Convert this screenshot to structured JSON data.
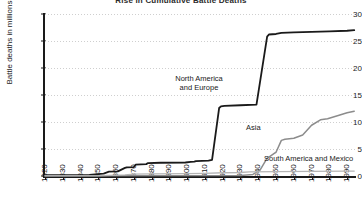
{
  "chart_data": {
    "type": "line",
    "title": "Rise in Cumulative Battle Deaths",
    "xlabel": "",
    "ylabel": "Battle deaths in millions",
    "xlim": [
      1820,
      1995
    ],
    "ylim": [
      0,
      30
    ],
    "grid": true,
    "legend_position": "inline-annotations",
    "xticks": [
      "1820",
      "1830",
      "1840",
      "1850",
      "1860",
      "1870",
      "1880",
      "1890",
      "1900",
      "1910",
      "1920",
      "1930",
      "1940",
      "1950",
      "1960",
      "1970",
      "1980",
      "1990"
    ],
    "yticks": [
      "0",
      "5",
      "10",
      "15",
      "20",
      "25",
      "30"
    ],
    "series": [
      {
        "name": "North America and Europe",
        "color": "#1a1a1a",
        "width": 1.8,
        "label_lines": [
          "North America",
          "and Europe"
        ],
        "x": [
          1820,
          1845,
          1853,
          1856,
          1861,
          1865,
          1866,
          1870,
          1871,
          1877,
          1878,
          1885,
          1899,
          1902,
          1904,
          1905,
          1912,
          1914,
          1918,
          1919,
          1921,
          1930,
          1939,
          1945,
          1946,
          1950,
          1953,
          1960,
          1970,
          1980,
          1990,
          1994
        ],
        "y": [
          0.15,
          0.2,
          0.45,
          0.8,
          0.85,
          1.5,
          1.6,
          1.65,
          2.1,
          2.2,
          2.4,
          2.45,
          2.5,
          2.6,
          2.65,
          2.75,
          2.85,
          3.0,
          12.6,
          12.9,
          13.0,
          13.1,
          13.2,
          25.8,
          26.2,
          26.3,
          26.5,
          26.6,
          26.7,
          26.8,
          26.9,
          27.0
        ]
      },
      {
        "name": "Asia",
        "color": "#8c8c8c",
        "width": 1.5,
        "label": "Asia",
        "x": [
          1820,
          1930,
          1937,
          1941,
          1945,
          1946,
          1949,
          1950,
          1953,
          1955,
          1960,
          1965,
          1970,
          1975,
          1979,
          1985,
          1990,
          1994
        ],
        "y": [
          0.05,
          0.1,
          0.3,
          1.1,
          3.3,
          3.5,
          4.2,
          4.4,
          6.6,
          6.8,
          7.0,
          7.6,
          9.4,
          10.4,
          10.6,
          11.2,
          11.7,
          12.0
        ]
      },
      {
        "name": "South America and Mexico",
        "color": "#b5b5b5",
        "width": 1.3,
        "label": "South America and Mexico",
        "x": [
          1820,
          1850,
          1865,
          1870,
          1880,
          1900,
          1910,
          1920,
          1930,
          1935,
          1950,
          1970,
          1990,
          1994
        ],
        "y": [
          0.02,
          0.05,
          0.2,
          0.35,
          0.4,
          0.45,
          0.5,
          0.6,
          0.65,
          0.75,
          0.8,
          0.85,
          0.9,
          0.92
        ]
      }
    ]
  }
}
